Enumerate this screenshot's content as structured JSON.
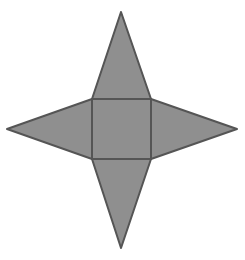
{
  "diagram": {
    "type": "square-pyramid-net",
    "colors": {
      "fill": "#8f8f8f",
      "stroke": "#555555",
      "background": "#ffffff"
    },
    "base_square": {
      "x1": 92,
      "y1": 99,
      "x2": 151,
      "y2": 159
    },
    "triangles": [
      {
        "name": "top-face",
        "apex": [
          121,
          12
        ]
      },
      {
        "name": "left-face",
        "apex": [
          7,
          129
        ]
      },
      {
        "name": "right-face",
        "apex": [
          237,
          129
        ]
      },
      {
        "name": "bottom-face",
        "apex": [
          121,
          248
        ]
      }
    ]
  }
}
